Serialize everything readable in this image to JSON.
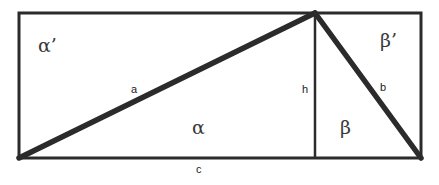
{
  "diagram": {
    "colors": {
      "stroke": "#2b2b2b",
      "text": "#3a3a3a",
      "background": "#ffffff"
    },
    "labels": {
      "alpha_prime": "α’",
      "beta_prime": "β’",
      "alpha": "α",
      "beta": "β",
      "side_a": "a",
      "side_b": "b",
      "side_c": "c",
      "height": "h"
    }
  }
}
